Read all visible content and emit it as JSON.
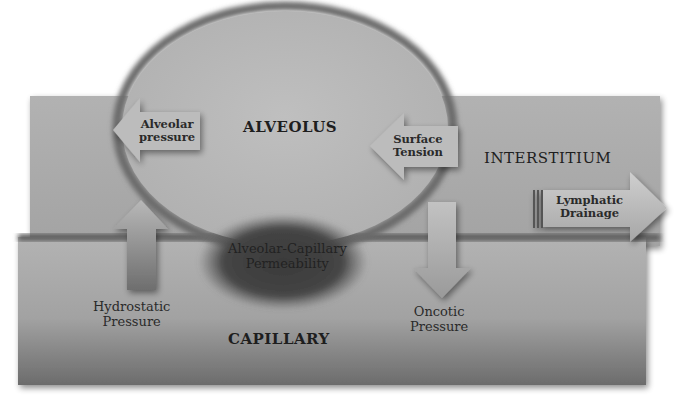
{
  "diagram": {
    "regions": {
      "alveolus": "ALVEOLUS",
      "interstitium": "INTERSTITIUM",
      "capillary": "CAPILLARY"
    },
    "forces": {
      "alveolar_pressure": {
        "line1": "Alveolar",
        "line2": "pressure",
        "direction": "left"
      },
      "surface_tension": {
        "line1": "Surface",
        "line2": "Tension",
        "direction": "left"
      },
      "hydrostatic_pressure": {
        "line1": "Hydrostatic",
        "line2": "Pressure",
        "direction": "up"
      },
      "oncotic_pressure": {
        "line1": "Oncotic",
        "line2": "Pressure",
        "direction": "down"
      },
      "lymphatic_drainage": {
        "line1": "Lymphatic",
        "line2": "Drainage",
        "direction": "right"
      }
    },
    "permeability": {
      "line1": "Alveolar-Capillary",
      "line2": "Permeability"
    },
    "colors": {
      "interstitium": "#a9a9a9",
      "alveolus_fill": "#b9b9b9",
      "alveolus_rim": "#6e6e6e",
      "capillary_top": "#b0b0b0",
      "capillary_bottom": "#6a6a6a",
      "membrane": "#5a5a5a",
      "permeability_blob": "#3c3c3c",
      "arrow": "#bdbdbd"
    }
  }
}
